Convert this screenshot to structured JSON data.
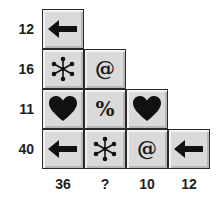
{
  "puzzle": {
    "row_totals": [
      "12",
      "16",
      "11",
      "40"
    ],
    "column_totals": [
      "36",
      "?",
      "10",
      "12"
    ],
    "grid": [
      [
        "arrow-left",
        null,
        null,
        null
      ],
      [
        "asterisk",
        "at",
        null,
        null
      ],
      [
        "heart",
        "percent",
        "heart",
        null
      ],
      [
        "arrow-left",
        "asterisk",
        "at",
        "arrow-left"
      ]
    ],
    "symbols": {
      "at": "@",
      "percent": "%"
    }
  }
}
